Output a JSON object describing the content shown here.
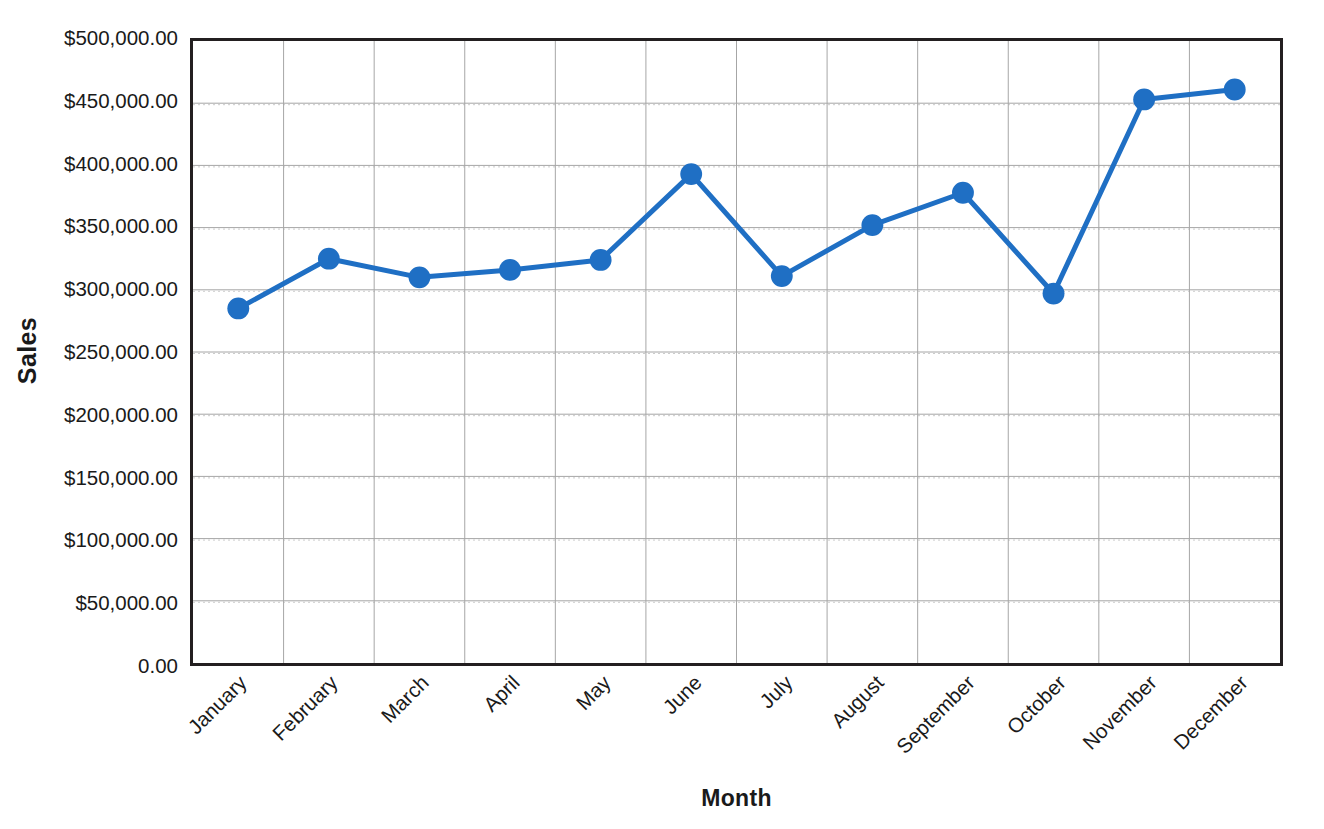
{
  "chart_data": {
    "type": "line",
    "title": "",
    "xlabel": "Month",
    "ylabel": "Sales",
    "categories": [
      "January",
      "February",
      "March",
      "April",
      "May",
      "June",
      "July",
      "August",
      "September",
      "October",
      "November",
      "December"
    ],
    "series": [
      {
        "name": "Sales",
        "color": "#1f6fc4",
        "values": [
          285000,
          325000,
          310000,
          316000,
          324000,
          393000,
          311000,
          352000,
          378000,
          297000,
          453000,
          461000
        ]
      }
    ],
    "ylim": [
      0,
      500000
    ],
    "ytick_values": [
      0,
      50000,
      100000,
      150000,
      200000,
      250000,
      300000,
      350000,
      400000,
      450000,
      500000
    ],
    "ytick_labels": [
      "0.00",
      "$50,000.00",
      "$100,000.00",
      "$150,000.00",
      "$200,000.00",
      "$250,000.00",
      "$300,000.00",
      "$350,000.00",
      "$400,000.00",
      "$450,000.00",
      "$500,000.00"
    ],
    "grid": {
      "horizontal": true,
      "vertical": true,
      "major_color": "#a6a6a6",
      "minor_color": "#cccccc",
      "minor_dotted": true
    },
    "legend": {
      "visible": false,
      "position": "none"
    },
    "marker": {
      "shape": "circle",
      "radius": 11,
      "color": "#1f6fc4"
    },
    "line": {
      "width": 5,
      "color": "#1f6fc4"
    },
    "axis": {
      "frame_color": "#231f20",
      "frame_width": 3
    },
    "xtick_rotation_degrees": -45
  }
}
